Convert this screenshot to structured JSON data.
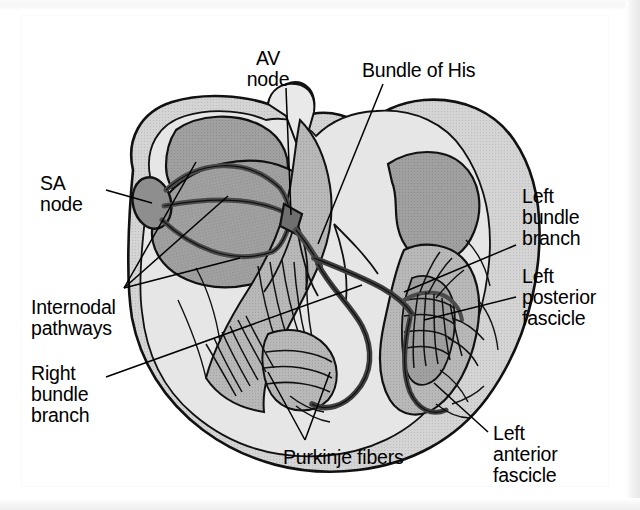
{
  "figure": {
    "type": "anatomical-diagram",
    "background_color": "#ffffff",
    "ink_color": "#000000",
    "palette": {
      "myocardium_light": "#dcdcdc",
      "myocardium_mid": "#b5b5b5",
      "chamber_dark": "#9a9a9a",
      "node_dark": "#8a8a8a",
      "outline": "#111111",
      "leader_line": "#000000",
      "page_edge": "#e8e8e8"
    }
  },
  "labels": [
    {
      "id": "av-node",
      "text": "AV\nnode",
      "x": 255,
      "y": 48,
      "align": "center",
      "leader_from": [
        286,
        88
      ],
      "leader_to": [
        291,
        215
      ]
    },
    {
      "id": "bundle-of-his",
      "text": "Bundle of His",
      "x": 362,
      "y": 60,
      "align": "left",
      "leader_from": [
        383,
        84
      ],
      "leader_to": [
        318,
        244
      ]
    },
    {
      "id": "sa-node",
      "text": "SA\nnode",
      "x": 40,
      "y": 173,
      "align": "left",
      "leader_from": [
        106,
        190
      ],
      "leader_to": [
        152,
        203
      ]
    },
    {
      "id": "left-bundle-branch",
      "text": "Left\nbundle\nbranch",
      "x": 522,
      "y": 186,
      "align": "left",
      "leader_from": [
        516,
        245
      ],
      "leader_to": [
        404,
        292
      ]
    },
    {
      "id": "left-posterior-fascicle",
      "text": "Left\nposterior\nfascicle",
      "x": 522,
      "y": 266,
      "align": "left",
      "leader_from": [
        516,
        297
      ],
      "leader_to": [
        424,
        320
      ]
    },
    {
      "id": "internodal-pathways",
      "text": "Internodal\npathways",
      "x": 31,
      "y": 297,
      "align": "left",
      "leader_from": [
        124,
        288
      ],
      "leader_to": [
        196,
        162
      ]
    },
    {
      "id": "right-bundle-branch",
      "text": "Right\nbundle\nbranch",
      "x": 31,
      "y": 363,
      "align": "left",
      "leader_from": [
        106,
        377
      ],
      "leader_to": [
        362,
        285
      ]
    },
    {
      "id": "purkinje-fibers",
      "text": "Purkinje fibers",
      "x": 283,
      "y": 447,
      "align": "left",
      "leader_from": [
        305,
        440
      ],
      "leader_to": [
        268,
        372
      ]
    },
    {
      "id": "left-anterior-fascicle",
      "text": "Left\nanterior\nfascicle",
      "x": 493,
      "y": 423,
      "align": "left",
      "leader_from": [
        488,
        432
      ],
      "leader_to": [
        434,
        383
      ]
    }
  ],
  "structures": [
    {
      "id": "sa-node-body",
      "name": "SA node",
      "kind": "node"
    },
    {
      "id": "av-node-body",
      "name": "AV node",
      "kind": "node"
    },
    {
      "id": "his-bundle",
      "name": "Bundle of His",
      "kind": "tract"
    },
    {
      "id": "internodal-tracts",
      "name": "Internodal pathways",
      "kind": "tract"
    },
    {
      "id": "rbb",
      "name": "Right bundle branch",
      "kind": "tract"
    },
    {
      "id": "lbb",
      "name": "Left bundle branch",
      "kind": "tract"
    },
    {
      "id": "la-fascicle",
      "name": "Left anterior fascicle",
      "kind": "tract"
    },
    {
      "id": "lp-fascicle",
      "name": "Left posterior fascicle",
      "kind": "tract"
    },
    {
      "id": "purkinje-network-right",
      "name": "Purkinje fibers (right ventricle)",
      "kind": "network"
    },
    {
      "id": "purkinje-network-left",
      "name": "Purkinje fibers (left ventricle)",
      "kind": "network"
    }
  ]
}
